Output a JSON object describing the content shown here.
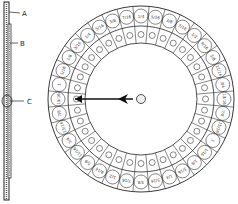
{
  "figure": {
    "labels": [
      {
        "id": "A",
        "text": "A",
        "x": 22,
        "y": 16,
        "lineFrom": [
          9,
          12
        ],
        "lineTo": [
          20,
          13
        ]
      },
      {
        "id": "B",
        "text": "B",
        "x": 20,
        "y": 46,
        "lineFrom": [
          10,
          43
        ],
        "lineTo": [
          18,
          43
        ]
      },
      {
        "id": "C",
        "text": "C",
        "x": 27,
        "y": 104,
        "lineFrom": [
          10,
          101
        ],
        "lineTo": [
          24,
          101
        ]
      }
    ],
    "dial": {
      "cx": 141,
      "cy": 99,
      "outer_r": 93,
      "mid_r": 73,
      "inner_r": 56,
      "segments": 36,
      "outer_labels": [
        "1/4",
        "5/16",
        "3/8",
        "7/16",
        "1/2",
        "9/16",
        "5/8",
        "11/16",
        "3/4",
        "13/16",
        "7/8",
        "15/16",
        "1",
        "1/16",
        "1/8",
        "3/16",
        "1/4",
        "5/16",
        "3/8",
        "7/16",
        "1/2",
        "9/16",
        "5/8",
        "11/16",
        "3/4",
        "13/16",
        "7/8",
        "15/16",
        "1",
        "1/16",
        "1/8",
        "3/16",
        "1/4",
        "5/16",
        "3/8",
        "7/16"
      ],
      "pointer": {
        "from_x": 133,
        "to_x": 75,
        "y": 99
      }
    }
  }
}
